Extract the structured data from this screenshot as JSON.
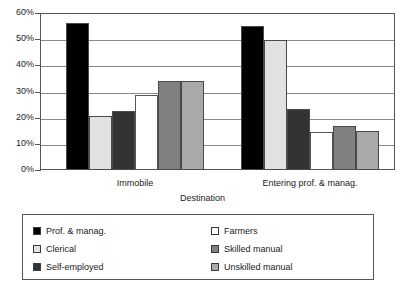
{
  "chart_data": {
    "type": "bar",
    "title": "",
    "xlabel": "Destination",
    "ylabel": "",
    "categories": [
      "Immobile",
      "Entering prof. & manag."
    ],
    "ylim": [
      0,
      60
    ],
    "ytick_labels": [
      "0%",
      "10%",
      "20%",
      "30%",
      "40%",
      "50%",
      "60%"
    ],
    "ytick_values": [
      0,
      10,
      20,
      30,
      40,
      50,
      60
    ],
    "grid": true,
    "legend_position": "below-plot",
    "series": [
      {
        "name": "Prof. & manag.",
        "color": "#000000",
        "values": [
          56.0,
          55.0
        ]
      },
      {
        "name": "Clerical",
        "color": "#e2e2e2",
        "values": [
          20.8,
          49.5
        ]
      },
      {
        "name": "Self-employed",
        "color": "#333333",
        "values": [
          22.7,
          23.2
        ]
      },
      {
        "name": "Farmers",
        "color": "#ffffff",
        "values": [
          28.8,
          14.6
        ]
      },
      {
        "name": "Skilled manual",
        "color": "#808080",
        "values": [
          34.2,
          16.8
        ]
      },
      {
        "name": "Unskilled manual",
        "color": "#a9a9a9",
        "values": [
          34.2,
          15.0
        ]
      }
    ]
  },
  "axis": {
    "x_title": "Destination"
  },
  "legend": {
    "left_column": [
      {
        "label": "Prof. & manag.",
        "color": "#000000"
      },
      {
        "label": "Clerical",
        "color": "#e2e2e2"
      },
      {
        "label": "Self-employed",
        "color": "#333333"
      }
    ],
    "right_column": [
      {
        "label": "Farmers",
        "color": "#ffffff"
      },
      {
        "label": "Skilled manual",
        "color": "#808080"
      },
      {
        "label": "Unskilled manual",
        "color": "#a9a9a9"
      }
    ]
  }
}
